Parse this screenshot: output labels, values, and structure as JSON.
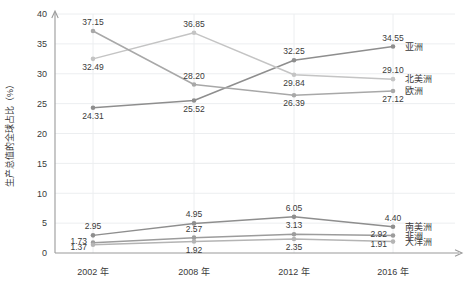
{
  "chart_data": {
    "type": "line",
    "title": "",
    "xlabel": "",
    "ylabel": "生产总值的全球占比（%）",
    "categories": [
      "2002 年",
      "2008 年",
      "2012 年",
      "2016 年"
    ],
    "ylim": [
      0,
      40
    ],
    "ytick_labels": [
      "0",
      "5",
      "10",
      "15",
      "20",
      "25",
      "30",
      "35",
      "40"
    ],
    "ytick_values": [
      0,
      5,
      10,
      15,
      20,
      25,
      30,
      35,
      40
    ],
    "grid": true,
    "legend_position": "right-inline-endpoints",
    "series": [
      {
        "name": "亚洲",
        "color": "#8e8e8e",
        "values": [
          24.31,
          25.52,
          32.25,
          34.55
        ],
        "labels": [
          "24.31",
          "25.52",
          "32.25",
          "34.55"
        ],
        "label_positions": [
          "below",
          "below",
          "above",
          "above"
        ]
      },
      {
        "name": "北美洲",
        "color": "#c4c4c4",
        "values": [
          32.49,
          36.85,
          29.84,
          29.1
        ],
        "labels": [
          "32.49",
          "36.85",
          "29.84",
          "29.10"
        ],
        "label_positions": [
          "below",
          "above",
          "below",
          "above"
        ]
      },
      {
        "name": "欧洲",
        "color": "#a8a8a8",
        "values": [
          37.15,
          28.2,
          26.39,
          27.12
        ],
        "labels": [
          "37.15",
          "28.20",
          "26.39",
          "27.12"
        ],
        "label_positions": [
          "above",
          "above",
          "below",
          "below"
        ]
      },
      {
        "name": "南美洲",
        "color": "#8e8e8e",
        "values": [
          2.95,
          4.95,
          6.05,
          4.4
        ],
        "labels": [
          "2.95",
          "4.95",
          "6.05",
          "4.40"
        ],
        "label_positions": [
          "above",
          "above",
          "above",
          "above"
        ]
      },
      {
        "name": "非洲",
        "color": "#9c9c9c",
        "values": [
          1.73,
          2.57,
          3.13,
          2.92
        ],
        "labels": [
          "1.73",
          "2.57",
          "3.13",
          "2.92"
        ],
        "label_positions": [
          "above-left",
          "above",
          "above",
          "above-left"
        ]
      },
      {
        "name": "大洋洲",
        "color": "#b4b4b4",
        "values": [
          1.37,
          1.92,
          2.35,
          1.91
        ],
        "labels": [
          "1.37",
          "1.92",
          "2.35",
          "1.91"
        ],
        "label_positions": [
          "below-left",
          "below",
          "below",
          "below-left"
        ]
      }
    ]
  }
}
